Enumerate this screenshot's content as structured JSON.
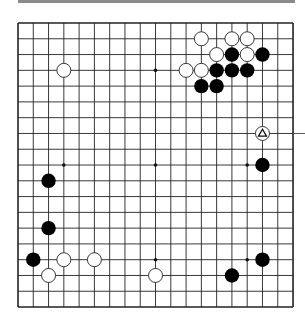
{
  "board": {
    "size": 19,
    "origin": {
      "x": 18,
      "y": 23
    },
    "spacing": {
      "x": 15.28,
      "y": 15.78
    },
    "line_color": "#222222",
    "hoshi": [
      [
        3,
        3
      ],
      [
        9,
        3
      ],
      [
        15,
        3
      ],
      [
        3,
        9
      ],
      [
        9,
        9
      ],
      [
        15,
        9
      ],
      [
        3,
        15
      ],
      [
        9,
        15
      ],
      [
        15,
        15
      ]
    ],
    "stones": [
      {
        "color": "white",
        "col": 3,
        "row": 3
      },
      {
        "color": "white",
        "col": 12,
        "row": 1
      },
      {
        "color": "white",
        "col": 14,
        "row": 1
      },
      {
        "color": "white",
        "col": 15,
        "row": 1
      },
      {
        "color": "white",
        "col": 13,
        "row": 2
      },
      {
        "color": "black",
        "col": 14,
        "row": 2
      },
      {
        "color": "white",
        "col": 15,
        "row": 2
      },
      {
        "color": "black",
        "col": 16,
        "row": 2
      },
      {
        "color": "white",
        "col": 11,
        "row": 3
      },
      {
        "color": "white",
        "col": 12,
        "row": 3
      },
      {
        "color": "black",
        "col": 13,
        "row": 3
      },
      {
        "color": "black",
        "col": 14,
        "row": 3
      },
      {
        "color": "black",
        "col": 15,
        "row": 3
      },
      {
        "color": "black",
        "col": 12,
        "row": 4
      },
      {
        "color": "black",
        "col": 13,
        "row": 4
      },
      {
        "color": "white",
        "col": 16,
        "row": 7,
        "marker": "triangle"
      },
      {
        "color": "black",
        "col": 16,
        "row": 9
      },
      {
        "color": "black",
        "col": 2,
        "row": 10
      },
      {
        "color": "black",
        "col": 2,
        "row": 13
      },
      {
        "color": "black",
        "col": 1,
        "row": 15
      },
      {
        "color": "white",
        "col": 3,
        "row": 15
      },
      {
        "color": "white",
        "col": 5,
        "row": 15
      },
      {
        "color": "black",
        "col": 16,
        "row": 15
      },
      {
        "color": "white",
        "col": 2,
        "row": 16
      },
      {
        "color": "white",
        "col": 9,
        "row": 16
      },
      {
        "color": "black",
        "col": 14,
        "row": 16
      }
    ],
    "pointer_line": {
      "row": 7,
      "to_x": 305
    }
  }
}
